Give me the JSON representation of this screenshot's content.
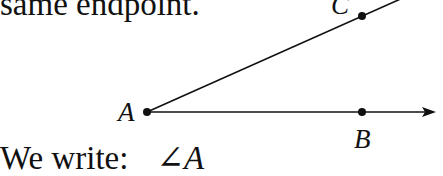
{
  "text": {
    "top_line": "same endpoint.",
    "bottom_prefix": "We write:",
    "angle_symbol": "∠",
    "angle_name": "A"
  },
  "figure": {
    "points": [
      {
        "label": "A",
        "x": 147,
        "y": 112
      },
      {
        "label": "B",
        "x": 362,
        "y": 112
      },
      {
        "label": "C",
        "x": 362,
        "y": 16
      }
    ],
    "rays": [
      {
        "from": "A",
        "through": "B",
        "arrow": true
      },
      {
        "from": "A",
        "through": "C",
        "arrow": false
      }
    ]
  }
}
